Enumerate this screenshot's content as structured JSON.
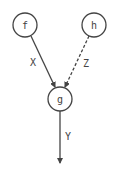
{
  "diagram": {
    "nodes": [
      {
        "id": "f",
        "label": "f"
      },
      {
        "id": "h",
        "label": "h"
      },
      {
        "id": "g",
        "label": "g"
      }
    ],
    "edges": [
      {
        "from": "f",
        "to": "g",
        "label": "X",
        "style": "solid"
      },
      {
        "from": "h",
        "to": "g",
        "label": "Z",
        "style": "dashed"
      },
      {
        "from": "g",
        "to": "out",
        "label": "Y",
        "style": "solid"
      }
    ],
    "colors": {
      "stroke": "#444444",
      "background": "#ffffff"
    }
  }
}
